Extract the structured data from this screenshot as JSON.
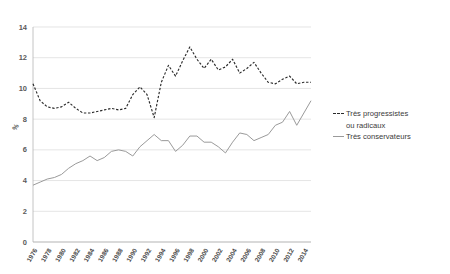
{
  "chart_data": {
    "type": "line",
    "title": "",
    "subtitle": "",
    "xlabel": "",
    "ylabel": "%",
    "ylim": [
      0,
      14
    ],
    "ytick_step": 2,
    "yticks": [
      "0",
      "2",
      "4",
      "6",
      "8",
      "10",
      "12",
      "14"
    ],
    "grid": true,
    "legend_position": "right",
    "x": [
      1976,
      1977,
      1978,
      1979,
      1980,
      1981,
      1982,
      1983,
      1984,
      1985,
      1986,
      1987,
      1988,
      1989,
      1990,
      1991,
      1992,
      1993,
      1994,
      1995,
      1996,
      1997,
      1998,
      1999,
      2000,
      2001,
      2002,
      2003,
      2004,
      2005,
      2006,
      2007,
      2008,
      2009,
      2010,
      2011,
      2012,
      2013,
      2014,
      2015
    ],
    "xtick_labels": [
      "1976",
      "1978",
      "1980",
      "1982",
      "1984",
      "1986",
      "1988",
      "1990",
      "1992",
      "1994",
      "1996",
      "1998",
      "2000",
      "2002",
      "2004",
      "2006",
      "2008",
      "2010",
      "2012",
      "2014"
    ],
    "series": [
      {
        "name": "Très progressistes ou radicaux",
        "style": "dashed",
        "color": "#2b2b2b",
        "values": [
          10.3,
          9.2,
          8.8,
          8.7,
          8.8,
          9.1,
          8.7,
          8.4,
          8.4,
          8.5,
          8.6,
          8.7,
          8.6,
          8.7,
          9.6,
          10.1,
          9.6,
          8.1,
          10.4,
          11.5,
          10.8,
          11.8,
          12.7,
          11.9,
          11.3,
          11.9,
          11.2,
          11.4,
          11.9,
          11.0,
          11.3,
          11.7,
          11.0,
          10.4,
          10.3,
          10.6,
          10.8,
          10.3,
          10.4,
          10.4
        ]
      },
      {
        "name": "Très conservateurs",
        "style": "solid",
        "color": "#9a9a9a",
        "values": [
          3.7,
          3.9,
          4.1,
          4.2,
          4.4,
          4.8,
          5.1,
          5.3,
          5.6,
          5.3,
          5.5,
          5.9,
          6.0,
          5.9,
          5.6,
          6.2,
          6.6,
          7.0,
          6.6,
          6.6,
          5.9,
          6.3,
          6.9,
          6.9,
          6.5,
          6.5,
          6.2,
          5.8,
          6.5,
          7.1,
          7.0,
          6.6,
          6.8,
          7.0,
          7.6,
          7.8,
          8.5,
          7.6,
          8.4,
          9.2
        ]
      }
    ]
  },
  "legend": {
    "items": [
      {
        "label_line1": "Très progressistes",
        "label_line2": "ou radicaux",
        "style": "dashed"
      },
      {
        "label_line1": "Très conservateurs",
        "label_line2": "",
        "style": "solid"
      }
    ]
  },
  "axis": {
    "y_title": "%"
  },
  "colors": {
    "dashed_series": "#2b2b2b",
    "solid_series": "#9a9a9a",
    "gridline": "#d9d9d9",
    "text": "#3b3b3b",
    "background": "#ffffff"
  }
}
